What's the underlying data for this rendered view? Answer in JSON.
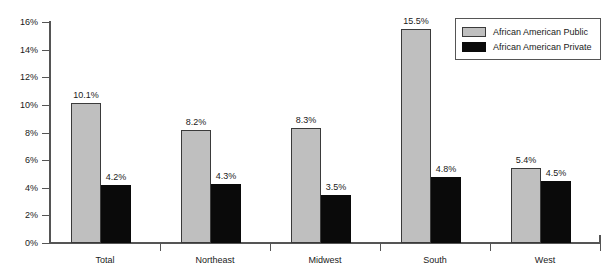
{
  "chart_data": {
    "type": "bar",
    "title": "",
    "subtitle": "",
    "xlabel": "",
    "ylabel": "",
    "categories": [
      "Total",
      "Northeast",
      "Midwest",
      "South",
      "West"
    ],
    "series": [
      {
        "name": "African American Public",
        "color": "#bfbfbf",
        "values": [
          10.1,
          8.2,
          8.3,
          15.5,
          5.4
        ],
        "labels": [
          "10.1%",
          "8.2%",
          "8.3%",
          "15.5%",
          "5.4%"
        ]
      },
      {
        "name": "African American Private",
        "color": "#0a0a0a",
        "values": [
          4.2,
          4.3,
          3.5,
          4.8,
          4.5
        ],
        "labels": [
          "4.2%",
          "4.3%",
          "3.5%",
          "4.8%",
          "4.5%"
        ]
      }
    ],
    "ylim": [
      0,
      16
    ],
    "ytick_values": [
      0,
      2,
      4,
      6,
      8,
      10,
      12,
      14,
      16
    ],
    "ytick_labels": [
      "0%",
      "2%",
      "4%",
      "6%",
      "8%",
      "10%",
      "12%",
      "14%",
      "16%"
    ],
    "grid": false,
    "legend_position": "top-right",
    "value_labels_shown": true,
    "units": "percent"
  },
  "legend": {
    "entries": [
      {
        "label": "African American Public",
        "swatch": "public"
      },
      {
        "label": "African American Private",
        "swatch": "private"
      }
    ]
  }
}
